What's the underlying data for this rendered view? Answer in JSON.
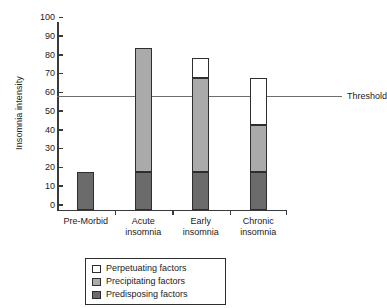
{
  "chart_data": {
    "type": "bar",
    "stacked": true,
    "title": "",
    "xlabel": "",
    "ylabel": "Insomnia intensity",
    "ylim": [
      0,
      100
    ],
    "ytick_step": 10,
    "yticks": [
      100,
      90,
      80,
      70,
      60,
      50,
      40,
      30,
      20,
      10,
      0
    ],
    "grid": false,
    "legend_position": "bottom",
    "categories": [
      "Pre-Morbid",
      "Acute\ninsomnia",
      "Early\ninsomnia",
      "Chronic\ninsomnia"
    ],
    "series": [
      {
        "name": "Predisposing factors",
        "color": "#6b6b6b",
        "values": [
          20,
          20,
          20,
          20
        ]
      },
      {
        "name": "Precipitating factors",
        "color": "#aaaaaa",
        "values": [
          0,
          66,
          50,
          25
        ]
      },
      {
        "name": "Perpetuating factors",
        "color": "#ffffff",
        "values": [
          0,
          0,
          11,
          25
        ]
      }
    ],
    "totals": [
      20,
      86,
      81,
      70
    ],
    "annotations": [
      {
        "name": "threshold",
        "label": "Threshold",
        "value": 60,
        "color": "#6d6d6d"
      }
    ]
  },
  "legend": {
    "entries": [
      {
        "label": "Perpetuating factors",
        "color": "#ffffff"
      },
      {
        "label": "Precipitating factors",
        "color": "#aaaaaa"
      },
      {
        "label": "Predisposing factors",
        "color": "#6b6b6b"
      }
    ]
  }
}
